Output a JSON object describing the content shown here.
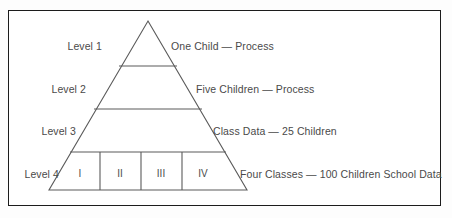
{
  "figure": {
    "border_color": "#1c1c1c",
    "line_color": "#5a5a5a",
    "text_color": "#4a4a4a",
    "background": "#ffffff"
  },
  "pyramid": {
    "levels": [
      {
        "id": "level-1",
        "left_label": "Level 1",
        "right_label": "One Child — Process"
      },
      {
        "id": "level-2",
        "left_label": "Level 2",
        "right_label": "Five Children — Process"
      },
      {
        "id": "level-3",
        "left_label": "Level 3",
        "right_label": "Class Data — 25 Children"
      },
      {
        "id": "level-4",
        "left_label": "Level 4",
        "right_label": "Four Classes — 100 Children School Data"
      }
    ],
    "classes": [
      {
        "id": "class-1",
        "label": "I"
      },
      {
        "id": "class-2",
        "label": "II"
      },
      {
        "id": "class-3",
        "label": "III"
      },
      {
        "id": "class-4",
        "label": "IV"
      }
    ]
  }
}
